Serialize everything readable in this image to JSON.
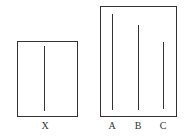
{
  "diagram": {
    "title": "",
    "reference_card": {
      "label": "X",
      "line_length_px": 65
    },
    "comparison_card": {
      "lines": [
        {
          "label": "A",
          "line_length_px": 96
        },
        {
          "label": "B",
          "line_length_px": 85
        },
        {
          "label": "C",
          "line_length_px": 67
        }
      ]
    },
    "colors": {
      "stroke": "#333333",
      "background": "#ffffff"
    }
  }
}
